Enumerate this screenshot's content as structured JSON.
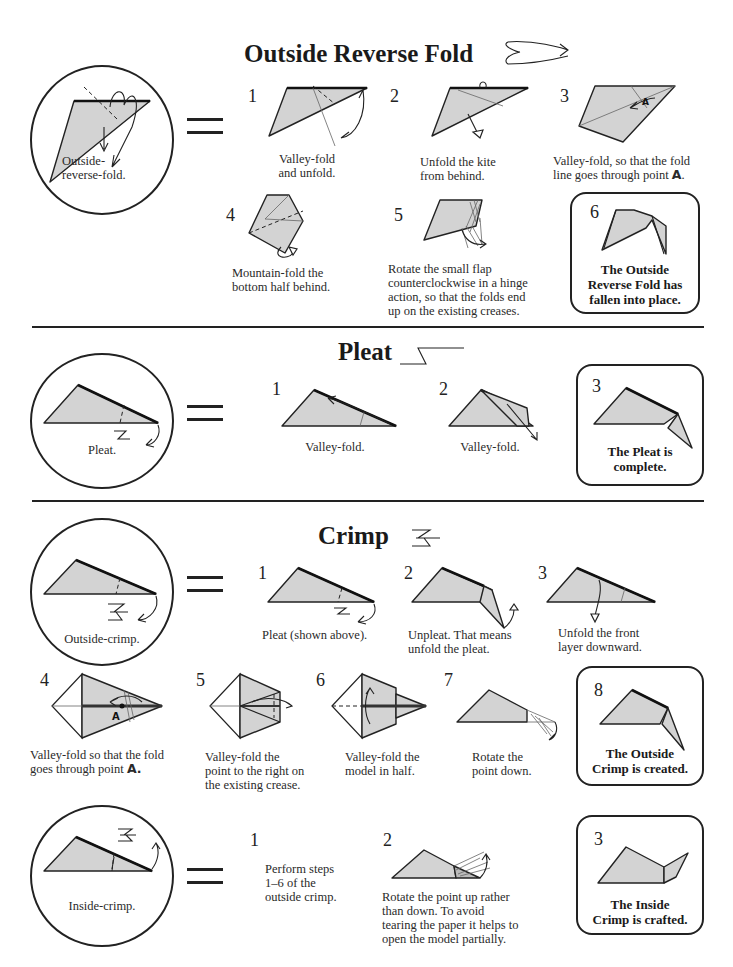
{
  "sections": {
    "outside_reverse_fold": {
      "title": "Outside Reverse Fold",
      "symbol_icon": "outside-reverse-fold-symbol",
      "summary_caption": "Outside-\nreverse-fold.",
      "summary_caption_line1": "Outside-",
      "summary_caption_line2": "reverse-fold.",
      "steps": [
        {
          "number": "1",
          "line1": "Valley-fold",
          "line2": "and unfold."
        },
        {
          "number": "2",
          "line1": "Unfold the kite",
          "line2": "from behind."
        },
        {
          "number": "3",
          "line1": "Valley-fold, so that the fold",
          "line2_prefix": "line goes through point ",
          "point": "A",
          "line2_suffix": "."
        },
        {
          "number": "4",
          "line1": "Mountain-fold the",
          "line2": "bottom half behind."
        },
        {
          "number": "5",
          "line1": "Rotate the small flap",
          "line2": "counterclockwise in a hinge",
          "line3": "action, so that the folds end",
          "line4": "up on the existing creases."
        }
      ],
      "result": {
        "number": "6",
        "line1": "The Outside",
        "line2": "Reverse Fold has",
        "line3": "fallen into place."
      }
    },
    "pleat": {
      "title": "Pleat",
      "symbol_icon": "pleat-symbol",
      "summary_caption": "Pleat.",
      "steps": [
        {
          "number": "1",
          "caption": "Valley-fold."
        },
        {
          "number": "2",
          "caption": "Valley-fold."
        }
      ],
      "result": {
        "number": "3",
        "line1": "The Pleat is",
        "line2": "complete."
      }
    },
    "crimp": {
      "title": "Crimp",
      "symbol_icon": "crimp-symbol",
      "summary_caption": "Outside-crimp.",
      "steps": [
        {
          "number": "1",
          "line1": "Pleat (shown above).",
          "line2": ""
        },
        {
          "number": "2",
          "line1": "Unpleat.  That means",
          "line2": "unfold the pleat."
        },
        {
          "number": "3",
          "line1": "Unfold the front",
          "line2": "layer downward."
        },
        {
          "number": "4",
          "line1": "Valley-fold so that the fold",
          "line2_prefix": "goes through point ",
          "point": "A."
        },
        {
          "number": "5",
          "line1": "Valley-fold the",
          "line2": "point to the right on",
          "line3": "the existing crease."
        },
        {
          "number": "6",
          "line1": "Valley-fold the",
          "line2": "model in half."
        },
        {
          "number": "7",
          "line1": "Rotate the",
          "line2": "point down."
        }
      ],
      "result": {
        "number": "8",
        "line1": "The Outside",
        "line2": "Crimp is created."
      }
    },
    "inside_crimp": {
      "summary_caption": "Inside-crimp.",
      "steps": [
        {
          "number": "1",
          "line1": "Perform steps",
          "line2": "1–6 of the",
          "line3": "outside crimp."
        },
        {
          "number": "2",
          "line1": "Rotate the point up rather",
          "line2": "than down.  To avoid",
          "line3": "tearing the paper it helps to",
          "line4": "open the model partially."
        }
      ],
      "result": {
        "number": "3",
        "line1": "The Inside",
        "line2": "Crimp is crafted."
      }
    }
  },
  "colors": {
    "paper_fill": "#d3d3d3",
    "line": "#222222",
    "background": "#ffffff"
  }
}
